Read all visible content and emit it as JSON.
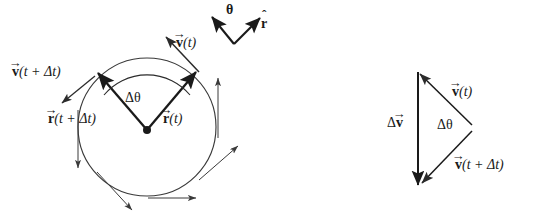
{
  "figure": {
    "background_color": "#ffffff",
    "stroke_color": "#1a1a1a",
    "width": 539,
    "height": 223
  },
  "left_panel": {
    "name": "circular-motion-diagram",
    "circle": {
      "cx": 147,
      "cy": 127,
      "r": 69,
      "stroke": "#3a3a3a"
    },
    "center_dot": {
      "cx": 147,
      "cy": 130,
      "r": 4
    },
    "labels": {
      "v_t": {
        "vector": "v",
        "arg": "(t)"
      },
      "v_t_dt": {
        "vector": "v",
        "arg": "(t + Δt)"
      },
      "r_t": {
        "vector": "r",
        "arg": "(t)"
      },
      "r_t_dt": {
        "vector": "r",
        "arg": "(t + Δt)"
      },
      "delta_theta": "Δθ",
      "theta_hat": "θ",
      "r_hat": "r"
    },
    "angle_between_radii_deg": 84,
    "rotation_sense": "counterclockwise"
  },
  "right_panel": {
    "name": "velocity-difference-triangle",
    "labels": {
      "v_t": {
        "vector": "v",
        "arg": "(t)"
      },
      "v_t_dt": {
        "vector": "v",
        "arg": "(t + Δt)"
      },
      "delta_v": {
        "prefix": "Δ",
        "vector": "v"
      },
      "delta_theta": "Δθ"
    },
    "apex": {
      "x": 472,
      "y": 125
    },
    "top_vertex": {
      "x": 418,
      "y": 75
    },
    "bottom_vertex": {
      "x": 419,
      "y": 182
    }
  },
  "glyphs": {
    "vector_accent": "→",
    "hat_accent": "ˆ",
    "delta": "Δ",
    "theta": "θ"
  }
}
